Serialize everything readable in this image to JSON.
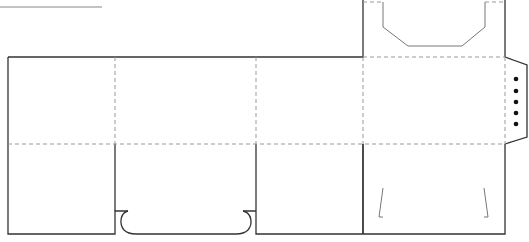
{
  "diagram": {
    "type": "box dieline / packaging template",
    "legend": {
      "cut_line": "solid",
      "fold_line": "dashed"
    },
    "colors": {
      "cut": "#333333",
      "fold": "#999999",
      "holes": "#111111",
      "background": "#ffffff"
    },
    "panels": [
      {
        "id": "panel-1",
        "x": 8,
        "width": 107
      },
      {
        "id": "panel-2",
        "x": 115,
        "width": 141
      },
      {
        "id": "panel-3",
        "x": 256,
        "width": 107
      },
      {
        "id": "panel-4",
        "x": 363,
        "width": 142
      }
    ],
    "features": {
      "handle_flap": "top of panel 4 with octagonal handle cutout",
      "glue_tab": "right side tab with 5 perforation holes",
      "bottom_notch": "rounded lock tab under panel 2",
      "slits": "two angled slits at bottom of panel 4"
    },
    "hole_count": 5
  }
}
